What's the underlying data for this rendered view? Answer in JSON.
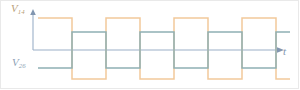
{
  "figure": {
    "kind": "timing-waveform-diagram",
    "background_color": "#ffffff",
    "border_color": "#e9e9e9",
    "width": 300,
    "height": 90
  },
  "labels": {
    "signal_top": "V",
    "signal_top_sub": "14",
    "signal_bottom": "V",
    "signal_bottom_sub": "26",
    "time_axis": "t"
  },
  "axes": {
    "time_axis_color": "#9bb0c8",
    "vertical_axis_color": "#9bb0c8",
    "time_axis_y": 50,
    "vertical_axis_x": 33,
    "vertical_axis_top": 12,
    "time_axis_start_x": 33,
    "time_axis_end_x": 282,
    "arrow_color": "#8296b0"
  },
  "chart_data": {
    "type": "line",
    "title": "",
    "xlabel": "t",
    "ylabel": "",
    "grid": false,
    "legend": "inline-labels",
    "xlim": [
      33,
      290
    ],
    "ylim": [
      0,
      90
    ],
    "series": [
      {
        "name": "V14",
        "label": "V14",
        "color": "#f2c99a",
        "style": "square-wave",
        "high_y": 18,
        "low_y": 79,
        "start_x": 38,
        "end_x": 290,
        "half_period": 34,
        "initial_level": "high",
        "transitions_x": [
          38,
          72,
          106,
          140,
          174,
          208,
          242,
          276
        ],
        "levels": [
          "high",
          "low",
          "high",
          "low",
          "high",
          "low",
          "high",
          "low"
        ]
      },
      {
        "name": "V26",
        "label": "V26",
        "color": "#8fb0b4",
        "style": "square-wave",
        "high_y": 32,
        "low_y": 68,
        "start_x": 38,
        "end_x": 290,
        "half_period": 34,
        "initial_level": "low",
        "transitions_x": [
          38,
          72,
          106,
          140,
          174,
          208,
          242,
          276
        ],
        "levels": [
          "low",
          "high",
          "low",
          "high",
          "low",
          "high",
          "low",
          "high"
        ]
      }
    ]
  }
}
